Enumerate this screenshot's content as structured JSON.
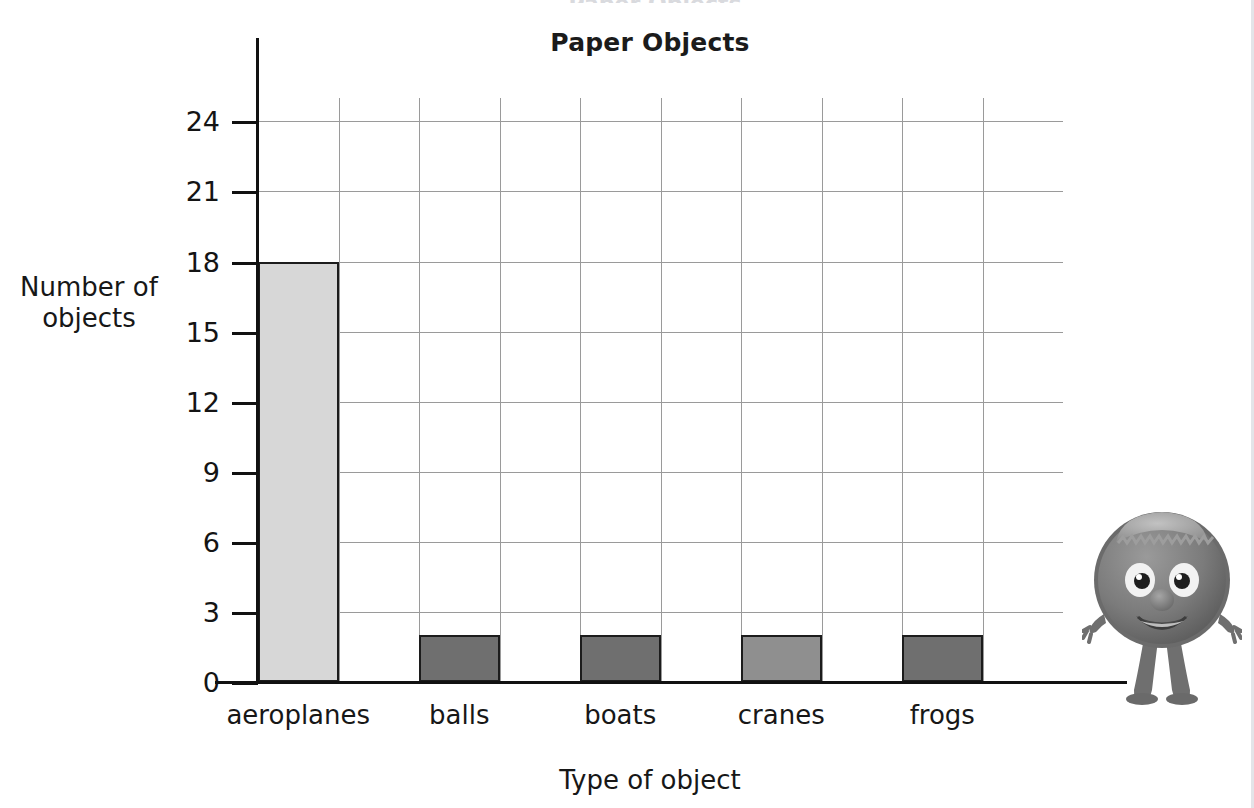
{
  "chart_data": {
    "type": "bar",
    "title": "Paper Objects",
    "xlabel": "Type of object",
    "ylabel": "Number of objects",
    "categories": [
      "aeroplanes",
      "balls",
      "boats",
      "cranes",
      "frogs"
    ],
    "values": [
      18,
      2,
      2,
      2,
      2
    ],
    "ylim": [
      0,
      25
    ],
    "ytick_labels": [
      "24",
      "21",
      "18",
      "15",
      "12",
      "9",
      "6",
      "3",
      "0"
    ],
    "ytick_values": [
      24,
      21,
      18,
      15,
      12,
      9,
      6,
      3,
      0
    ],
    "ytick_interval": 3,
    "grid": true,
    "grid_columns": 10,
    "legend": "none",
    "bar_colors": [
      "#d7d7d7",
      "#6f6f6f",
      "#6f6f6f",
      "#8f8f8f",
      "#6f6f6f"
    ],
    "bar_border_color": "#1c1c1c",
    "gridline_color": "#9a9a9a",
    "axis_color": "#111111",
    "background_color": "#ffffff"
  },
  "decoration": {
    "mascot_name": "furry-monster-mascot",
    "mascot_body_color": "#7c7c7c",
    "mascot_hair_color": "#a8a8a8",
    "bleed_text": "Paper Objects"
  }
}
